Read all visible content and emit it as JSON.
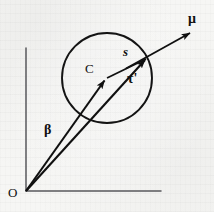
{
  "figure": {
    "name": "vector-diagram-sphere-scattering",
    "background_color": "#f6f6f4",
    "ink_color": "#101010",
    "axis_color": "#55555a",
    "labels": {
      "origin": "O",
      "mu": "μ",
      "s": "s",
      "center": "C",
      "tau_prime": "τ'",
      "beta": "β"
    },
    "axes": {
      "vertical": {
        "x": 26,
        "y_top": 48,
        "y_bottom": 191
      },
      "horizontal": {
        "y": 191,
        "x_left": 26,
        "x_right": 161
      }
    },
    "circle": {
      "cx": 107,
      "cy": 78,
      "r": 45
    },
    "vectors": [
      {
        "name": "beta",
        "label": "β",
        "from_x": 26,
        "from_y": 191,
        "to_x": 106,
        "to_y": 78
      },
      {
        "name": "tau-prime",
        "label": "τ'",
        "from_x": 26,
        "from_y": 191,
        "to_x": 147,
        "to_y": 58
      },
      {
        "name": "mu",
        "label": "μ",
        "from_x": 107,
        "from_y": 78,
        "to_x": 193,
        "to_y": 31
      }
    ],
    "segments": [
      {
        "name": "s",
        "label": "s",
        "from_x": 107,
        "from_y": 78,
        "to_x": 147,
        "to_y": 58
      }
    ]
  }
}
